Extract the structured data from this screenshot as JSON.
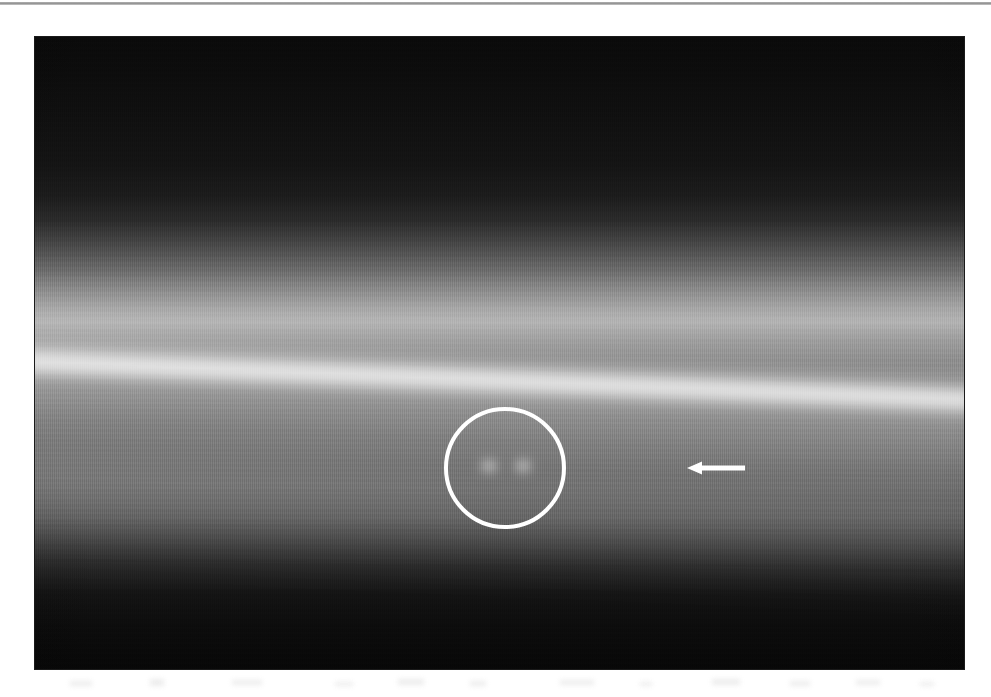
{
  "figure": {
    "kind": "scanned-grayscale-micrograph",
    "panel": {
      "x": 35,
      "y": 37,
      "width": 929,
      "height": 632,
      "background_color": "#050505"
    },
    "top_rule": {
      "name": "top-border-rule",
      "x": 0,
      "y": 2,
      "width": 991,
      "height": 3,
      "color": "#8e8e8e"
    },
    "band": {
      "label": "bright-horizontal-band",
      "core_y_left": 332,
      "core_y_right": 370,
      "tilt_degrees": 2.35,
      "peak_color": "#ffffff"
    },
    "annotations": [
      {
        "name": "circle-annotation",
        "shape": "circle",
        "cx": 505,
        "cy": 468,
        "r": 59,
        "stroke_color": "#ffffff",
        "stroke_width": 4
      },
      {
        "name": "arrow-annotation",
        "shape": "arrow",
        "direction": "left",
        "tip_x": 687,
        "tail_x": 745,
        "y": 468,
        "shaft_thickness": 5,
        "head_width": 15,
        "head_height": 13,
        "color": "#ffffff"
      }
    ],
    "features": [
      {
        "name": "bright-spot-left",
        "cx": 489,
        "cy": 466,
        "rx": 13,
        "ry": 11
      },
      {
        "name": "bright-spot-right",
        "cx": 523,
        "cy": 466,
        "rx": 13,
        "ry": 11
      }
    ],
    "smudges": [
      {
        "x": 70,
        "y": 681,
        "w": 22,
        "h": 5
      },
      {
        "x": 150,
        "y": 679,
        "w": 14,
        "h": 7
      },
      {
        "x": 232,
        "y": 680,
        "w": 30,
        "h": 5
      },
      {
        "x": 335,
        "y": 682,
        "w": 18,
        "h": 4
      },
      {
        "x": 398,
        "y": 679,
        "w": 26,
        "h": 6
      },
      {
        "x": 470,
        "y": 681,
        "w": 16,
        "h": 5
      },
      {
        "x": 560,
        "y": 680,
        "w": 34,
        "h": 5
      },
      {
        "x": 640,
        "y": 682,
        "w": 12,
        "h": 4
      },
      {
        "x": 712,
        "y": 679,
        "w": 28,
        "h": 6
      },
      {
        "x": 790,
        "y": 681,
        "w": 20,
        "h": 5
      },
      {
        "x": 856,
        "y": 680,
        "w": 24,
        "h": 5
      },
      {
        "x": 920,
        "y": 682,
        "w": 14,
        "h": 4
      }
    ]
  }
}
